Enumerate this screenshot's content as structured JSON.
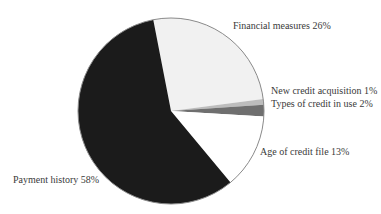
{
  "chart_data": {
    "type": "pie",
    "title": "",
    "start_angle_deg": -11,
    "direction": "clockwise",
    "center": [
      171,
      111
    ],
    "radius": 93,
    "slices": [
      {
        "label": "Financial measures",
        "value": 26,
        "color": "#f1f1f1",
        "text": "Financial measures 26%"
      },
      {
        "label": "New credit acquisition",
        "value": 1,
        "color": "#bdbdbd",
        "text": "New credit acquisition 1%"
      },
      {
        "label": "Types of credit in use",
        "value": 2,
        "color": "#6f6f6f",
        "text": "Types of credit in use 2%"
      },
      {
        "label": "Age of credit file",
        "value": 13,
        "color": "#ffffff",
        "text": "Age of credit file 13%"
      },
      {
        "label": "Payment history",
        "value": 58,
        "color": "#1b1b1b",
        "text": "Payment history 58%"
      }
    ],
    "outline_color": "#8a8a8a"
  }
}
